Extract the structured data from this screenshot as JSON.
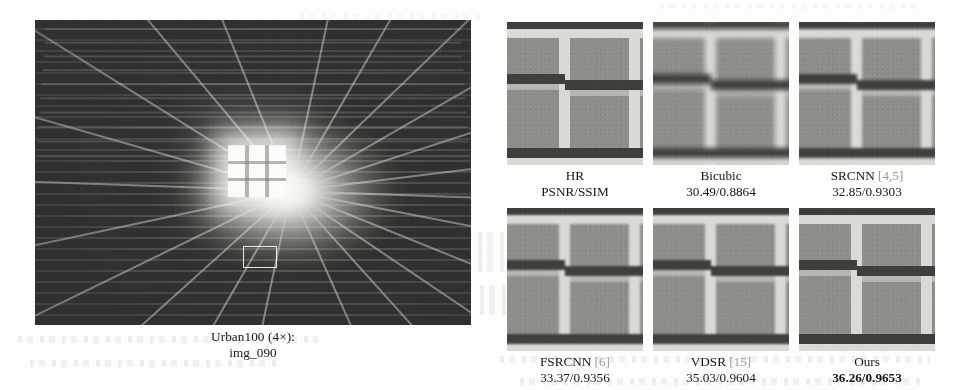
{
  "figure": {
    "type": "super-resolution-qualitative-comparison",
    "reference": {
      "dataset_label": "Urban100 (4×):",
      "image_id": "img_090",
      "scene_description": "interior-ceiling-with-skylight",
      "roi_marker": "white-rectangle"
    },
    "metric_header": {
      "name": "HR",
      "metric_label": "PSNR/SSIM"
    },
    "patches": [
      {
        "id": "hr",
        "method": "HR",
        "citation": "",
        "metric": "PSNR/SSIM",
        "is_best": false,
        "sharpness": "reference",
        "row": 0,
        "col": 0
      },
      {
        "id": "bicubic",
        "method": "Bicubic",
        "citation": "",
        "metric": "30.49/0.8864",
        "psnr": 30.49,
        "ssim": 0.8864,
        "is_best": false,
        "sharpness": "very-blurry",
        "row": 0,
        "col": 1
      },
      {
        "id": "srcnn",
        "method": "SRCNN",
        "citation": "[4,5]",
        "metric": "32.85/0.9303",
        "psnr": 32.85,
        "ssim": 0.9303,
        "is_best": false,
        "sharpness": "blurry",
        "row": 0,
        "col": 2
      },
      {
        "id": "fsrcnn",
        "method": "FSRCNN",
        "citation": "[6]",
        "metric": "33.37/0.9356",
        "psnr": 33.37,
        "ssim": 0.9356,
        "is_best": false,
        "sharpness": "moderate",
        "row": 1,
        "col": 0
      },
      {
        "id": "vdsr",
        "method": "VDSR",
        "citation": "[15]",
        "metric": "35.03/0.9604",
        "psnr": 35.03,
        "ssim": 0.9604,
        "is_best": false,
        "sharpness": "sharp",
        "row": 1,
        "col": 1
      },
      {
        "id": "ours",
        "method": "Ours",
        "citation": "",
        "metric": "36.26/0.9653",
        "psnr": 36.26,
        "ssim": 0.9653,
        "is_best": true,
        "sharpness": "sharpest",
        "row": 1,
        "col": 2
      }
    ]
  },
  "colors": {
    "page_background": "#fdfdfc",
    "text": "#161616",
    "citation_gray": "#9a9a9a",
    "patch_mid_gray": "#8d8d8a",
    "patch_bright_bar": "#d9d9d5",
    "patch_dark_bar": "#3e3e3c",
    "photo_dark": "#2e2e2e",
    "photo_skylight": "#fbfbf9",
    "roi_outline": "#fafaf8"
  }
}
